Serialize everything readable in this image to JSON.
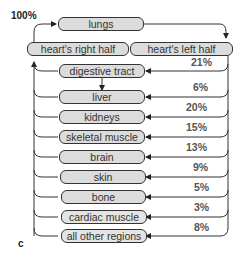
{
  "diagram": {
    "top_label": "100%",
    "panel_label": "c",
    "lungs": "lungs",
    "heart_right": "heart's right half",
    "heart_left": "heart's left half",
    "organs": [
      {
        "name": "digestive tract",
        "pct": "21%"
      },
      {
        "name": "liver",
        "pct": "6%"
      },
      {
        "name": "kidneys",
        "pct": "20%"
      },
      {
        "name": "skeletal muscle",
        "pct": "15%"
      },
      {
        "name": "brain",
        "pct": "13%"
      },
      {
        "name": "skin",
        "pct": "9%"
      },
      {
        "name": "bone",
        "pct": "5%"
      },
      {
        "name": "cardiac muscle",
        "pct": "3%"
      },
      {
        "name": "all other regions",
        "pct": "8%"
      }
    ]
  }
}
